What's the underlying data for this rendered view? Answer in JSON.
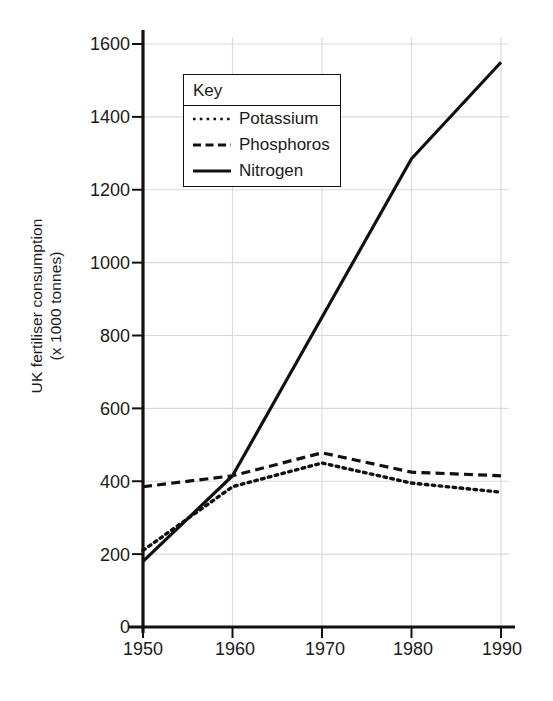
{
  "chart_data": {
    "type": "line",
    "title": "",
    "xlabel": "",
    "ylabel": "UK fertiliser consumption (x 1000 tonnes)",
    "ylabel_line1": "UK fertiliser consumption",
    "ylabel_line2": "(x 1000 tonnes)",
    "x": [
      1950,
      1960,
      1970,
      1980,
      1990
    ],
    "xtick_labels": [
      "1950",
      "1960",
      "1970",
      "1980",
      "1990"
    ],
    "ytick_labels": [
      "0",
      "200",
      "400",
      "600",
      "800",
      "1000",
      "1200",
      "1400",
      "1600"
    ],
    "yticks": [
      0,
      200,
      400,
      600,
      800,
      1000,
      1200,
      1400,
      1600
    ],
    "xlim": [
      1950,
      1990
    ],
    "ylim": [
      0,
      1600
    ],
    "grid": true,
    "legend_position": "upper-left-inside",
    "legend_title": "Key",
    "series": [
      {
        "name": "Potassium",
        "style": "dotted",
        "color": "#111111",
        "values": [
          210,
          385,
          450,
          395,
          370
        ]
      },
      {
        "name": "Phosphoros",
        "style": "dashed",
        "color": "#111111",
        "values": [
          385,
          415,
          478,
          425,
          415
        ]
      },
      {
        "name": "Nitrogen",
        "style": "solid",
        "color": "#111111",
        "values": [
          180,
          415,
          850,
          1285,
          1550
        ]
      }
    ]
  },
  "axis": {
    "colors": {
      "axis_line": "#111111",
      "gridline": "#d9d9d9",
      "text": "#1a1a1a",
      "background": "#ffffff"
    }
  },
  "legend": {
    "title": "Key",
    "entries": [
      {
        "label": "Potassium",
        "style": "dotted"
      },
      {
        "label": "Phosphoros",
        "style": "dashed"
      },
      {
        "label": "Nitrogen",
        "style": "solid"
      }
    ]
  }
}
